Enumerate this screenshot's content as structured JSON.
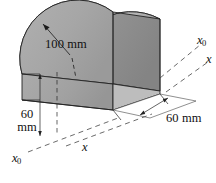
{
  "figure": {
    "type": "engineering-isometric-solid",
    "background_color": "#ffffff",
    "line_color": "#1a1a1a",
    "dimensions": [
      {
        "id": "radius",
        "text": "100 mm",
        "lines": [
          "100 mm"
        ],
        "value": 100,
        "unit": "mm",
        "kind": "radius"
      },
      {
        "id": "height",
        "text": "60 mm",
        "lines": [
          "60",
          "mm"
        ],
        "value": 60,
        "unit": "mm",
        "kind": "height"
      },
      {
        "id": "depth",
        "text": "60 mm",
        "lines": [
          "60 mm"
        ],
        "value": 60,
        "unit": "mm",
        "kind": "depth"
      }
    ],
    "axes": [
      {
        "id": "x0-upper-right",
        "symbol": "x",
        "subscript": "0"
      },
      {
        "id": "x-upper-right",
        "symbol": "x",
        "subscript": ""
      },
      {
        "id": "x0-lower-left",
        "symbol": "x",
        "subscript": "0"
      },
      {
        "id": "x-lower-middle",
        "symbol": "x",
        "subscript": ""
      }
    ],
    "surface_colors": {
      "near_semicircle_face": "#a8a8a8",
      "far_semicircle_face": "#8f8f8f",
      "curved_top_highlight": "#ececec",
      "curved_top_shadow": "#7c7c7c",
      "front_base_face": "#a0a0a0",
      "base_top_face": "#fdfdfd"
    }
  }
}
